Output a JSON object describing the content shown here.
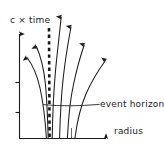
{
  "figure": {
    "title": "",
    "kind": "spacetime-diagram",
    "ink_color": "#1a1a1a",
    "background_color": "#ffffff"
  },
  "axes": {
    "y": {
      "label": "c × time",
      "has_arrowhead": true,
      "tick_count": 2
    },
    "x": {
      "label": "radius",
      "has_arrowhead": true,
      "tick_count": 0
    }
  },
  "annotations": {
    "event_horizon": {
      "label": "event horizon",
      "line_style": "dashed",
      "has_leader_line": true
    }
  },
  "worldlines": {
    "count": 6,
    "description": "outgoing light-ray worldlines bending away from the horizon"
  }
}
